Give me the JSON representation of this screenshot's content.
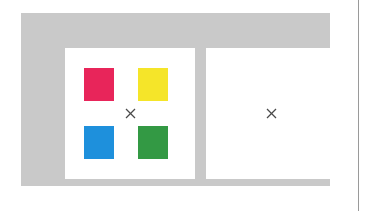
{
  "stage": {
    "width": 373,
    "height": 211,
    "background_color": "#FFFFFF"
  },
  "frame": {
    "label": "",
    "background_color": "#C9C9C9"
  },
  "panels": [
    {
      "id": "sample-array",
      "label": "",
      "background_color": "#FFFFFF",
      "fixation": {
        "glyph": "×",
        "color": "#4A4A4A"
      },
      "items": [
        {
          "position": "top-left",
          "color_name": "crimson",
          "color": "#E8255A"
        },
        {
          "position": "top-right",
          "color_name": "yellow",
          "color": "#F5E529"
        },
        {
          "position": "bottom-left",
          "color_name": "blue",
          "color": "#1E90DC"
        },
        {
          "position": "bottom-right",
          "color_name": "green",
          "color": "#339944"
        }
      ]
    },
    {
      "id": "blank-retention",
      "label": "",
      "background_color": "#FFFFFF",
      "fixation": {
        "glyph": "×",
        "color": "#4A4A4A"
      },
      "items": []
    }
  ],
  "right_rule": {
    "color": "#9A9A9A"
  }
}
